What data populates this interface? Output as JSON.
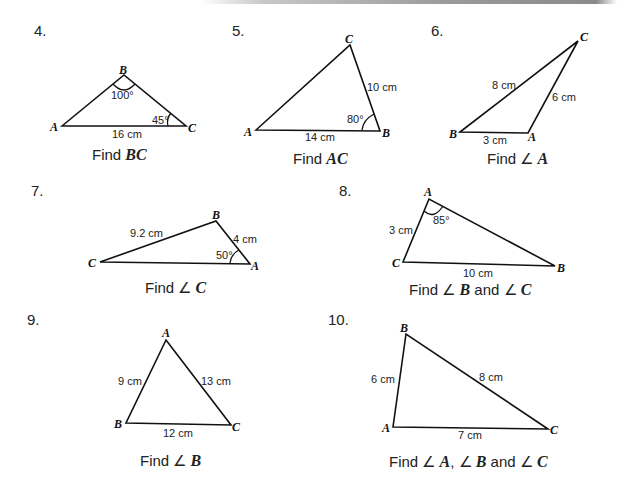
{
  "problems": [
    {
      "number": "4.",
      "vertices": {
        "A": "A",
        "B": "B",
        "C": "C"
      },
      "labels": {
        "angle_B": "100°",
        "angle_C": "45°",
        "side_AC": "16 cm"
      },
      "task": {
        "prefix": "Find ",
        "target": "BC",
        "middle": "",
        "target2": "",
        "target3": ""
      }
    },
    {
      "number": "5.",
      "vertices": {
        "A": "A",
        "B": "B",
        "C": "C"
      },
      "labels": {
        "side_BC": "10 cm",
        "angle_B": "80°",
        "side_AB": "14 cm"
      },
      "task": {
        "prefix": "Find ",
        "target": "AC"
      }
    },
    {
      "number": "6.",
      "vertices": {
        "A": "A",
        "B": "B",
        "C": "C"
      },
      "labels": {
        "side_BC": "8 cm",
        "side_AC": "6 cm",
        "side_AB": "3 cm"
      },
      "task": {
        "prefix": "Find ",
        "angle_symbol": "∠",
        "target": "A"
      }
    },
    {
      "number": "7.",
      "vertices": {
        "A": "A",
        "B": "B",
        "C": "C"
      },
      "labels": {
        "side_BC": "9.2 cm",
        "side_AB": "4 cm",
        "angle_A": "50°"
      },
      "task": {
        "prefix": "Find ",
        "angle_symbol": "∠",
        "target": "C"
      }
    },
    {
      "number": "8.",
      "vertices": {
        "A": "A",
        "B": "B",
        "C": "C"
      },
      "labels": {
        "angle_A": "85°",
        "side_AC": "3 cm",
        "side_BC": "10 cm"
      },
      "task": {
        "prefix": "Find ",
        "angle_symbol": "∠",
        "target": "B",
        "joiner": " and ",
        "target2": "C"
      }
    },
    {
      "number": "9.",
      "vertices": {
        "A": "A",
        "B": "B",
        "C": "C"
      },
      "labels": {
        "side_AB": "9 cm",
        "side_AC": "13 cm",
        "side_BC": "12 cm"
      },
      "task": {
        "prefix": "Find ",
        "angle_symbol": "∠",
        "target": "B"
      }
    },
    {
      "number": "10.",
      "vertices": {
        "A": "A",
        "B": "B",
        "C": "C"
      },
      "labels": {
        "side_AB": "6 cm",
        "side_BC": "8 cm",
        "side_AC": "7 cm"
      },
      "task": {
        "prefix": "Find ",
        "angle_symbol": "∠",
        "target": "A",
        "sep": ", ",
        "target2": "B",
        "joiner": " and ",
        "target3": "C"
      }
    }
  ]
}
